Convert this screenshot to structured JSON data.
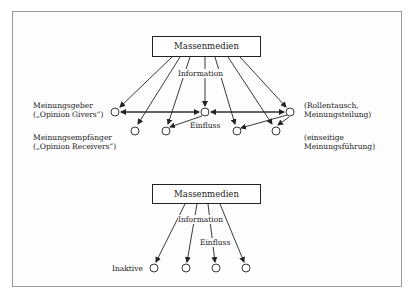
{
  "diagram": {
    "top": {
      "media_box": "Massenmedien",
      "information_label": "Information",
      "influence_label": "Einfluss",
      "left_labels": {
        "opinion_givers_line1": "Meinungsgeber",
        "opinion_givers_line2": "(„Opinion Givers“)",
        "opinion_receivers_line1": "Meinungsempfänger",
        "opinion_receivers_line2": "(„Opinion Receivers“)"
      },
      "right_labels": {
        "role_exchange_line1": "(Rollentausch,",
        "role_exchange_line2": "Meinungsteilung)",
        "one_sided_line1": "(einseitige",
        "one_sided_line2": "Meinungsführung)"
      }
    },
    "bottom": {
      "media_box": "Massenmedien",
      "information_label": "Information",
      "influence_label": "Einfluss",
      "inactive_label": "Inaktive"
    },
    "colors": {
      "line": "#222222",
      "frame": "#9a9a9a",
      "background": "#ffffff"
    }
  }
}
